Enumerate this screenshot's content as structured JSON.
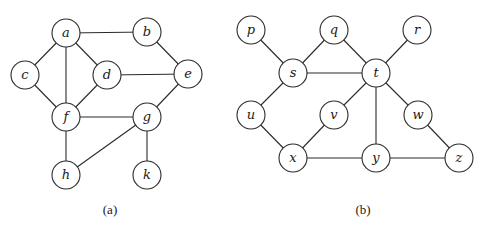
{
  "graphs": [
    {
      "id": "a",
      "caption": "(a)",
      "caption_pos": [
        110,
        214
      ],
      "node_radius": 14,
      "nodes": [
        {
          "id": "a",
          "label": "a",
          "x": 66,
          "y": 33
        },
        {
          "id": "b",
          "label": "b",
          "x": 147,
          "y": 32
        },
        {
          "id": "c",
          "label": "c",
          "x": 25,
          "y": 75
        },
        {
          "id": "d",
          "label": "d",
          "x": 107,
          "y": 75
        },
        {
          "id": "e",
          "label": "e",
          "x": 188,
          "y": 74
        },
        {
          "id": "f",
          "label": "f",
          "x": 66,
          "y": 117
        },
        {
          "id": "g",
          "label": "g",
          "x": 147,
          "y": 117
        },
        {
          "id": "h",
          "label": "h",
          "x": 66,
          "y": 175
        },
        {
          "id": "k",
          "label": "k",
          "x": 147,
          "y": 175
        }
      ],
      "edges": [
        [
          "a",
          "b"
        ],
        [
          "a",
          "c"
        ],
        [
          "a",
          "d"
        ],
        [
          "a",
          "f"
        ],
        [
          "b",
          "e"
        ],
        [
          "c",
          "f"
        ],
        [
          "d",
          "f"
        ],
        [
          "d",
          "e"
        ],
        [
          "e",
          "g"
        ],
        [
          "f",
          "g"
        ],
        [
          "f",
          "h"
        ],
        [
          "g",
          "h"
        ],
        [
          "g",
          "k"
        ]
      ]
    },
    {
      "id": "b",
      "caption": "(b)",
      "caption_pos": [
        363,
        214
      ],
      "node_radius": 14,
      "nodes": [
        {
          "id": "p",
          "label": "p",
          "x": 251,
          "y": 30
        },
        {
          "id": "q",
          "label": "q",
          "x": 334,
          "y": 30
        },
        {
          "id": "r",
          "label": "r",
          "x": 417,
          "y": 30
        },
        {
          "id": "s",
          "label": "s",
          "x": 293,
          "y": 73
        },
        {
          "id": "t",
          "label": "t",
          "x": 376,
          "y": 73
        },
        {
          "id": "u",
          "label": "u",
          "x": 251,
          "y": 115
        },
        {
          "id": "v",
          "label": "v",
          "x": 334,
          "y": 115
        },
        {
          "id": "w",
          "label": "w",
          "x": 418,
          "y": 115
        },
        {
          "id": "x",
          "label": "x",
          "x": 293,
          "y": 158
        },
        {
          "id": "y",
          "label": "y",
          "x": 376,
          "y": 158
        },
        {
          "id": "z",
          "label": "z",
          "x": 459,
          "y": 158
        }
      ],
      "edges": [
        [
          "p",
          "s"
        ],
        [
          "q",
          "s"
        ],
        [
          "q",
          "t"
        ],
        [
          "r",
          "t"
        ],
        [
          "s",
          "t"
        ],
        [
          "s",
          "u"
        ],
        [
          "t",
          "v"
        ],
        [
          "t",
          "y"
        ],
        [
          "t",
          "w"
        ],
        [
          "u",
          "x"
        ],
        [
          "v",
          "x"
        ],
        [
          "x",
          "y"
        ],
        [
          "y",
          "z"
        ],
        [
          "w",
          "z"
        ]
      ]
    }
  ]
}
